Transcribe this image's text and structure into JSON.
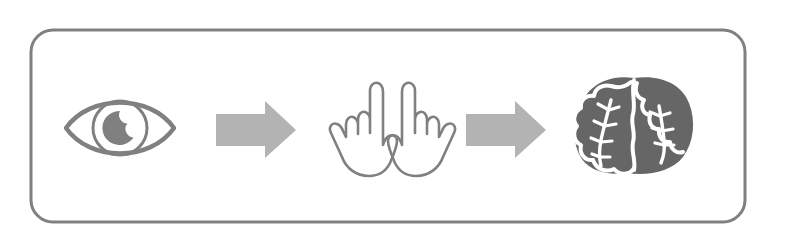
{
  "diagram": {
    "type": "process-flow",
    "title": "Look → Point → Think",
    "orientation": "horizontal",
    "background_color": "#ffffff",
    "container": {
      "shape": "rounded-rectangle",
      "stroke_color": "#808080",
      "stroke_width": 3,
      "corner_radius": 22,
      "fill": "none",
      "x": 31,
      "y": 30,
      "width": 714,
      "height": 192
    },
    "colors": {
      "outline": "#808080",
      "arrow_fill": "#b3b3b3",
      "solid_fill": "#666666",
      "vein": "#ffffff"
    },
    "steps": [
      {
        "index": 1,
        "icon": "eye-icon",
        "label": "Eye",
        "description": "Almond shaped eye with round iris and filled pupil with highlight notch",
        "style": "outline",
        "color": "#808080"
      },
      {
        "index": 2,
        "icon": "pointing-hands-icon",
        "label": "Pointing hands",
        "description": "Two mirrored hands with index fingers extended upward",
        "style": "outline",
        "color": "#808080"
      },
      {
        "index": 3,
        "icon": "brain-cabbage-icon",
        "label": "Brain",
        "description": "Solid rounded brain-like form with two lobes and white branching veins",
        "style": "filled",
        "color": "#666666"
      }
    ],
    "connectors": [
      {
        "index": 1,
        "icon": "arrow-right-icon",
        "label": "leads to",
        "direction": "right",
        "color": "#b3b3b3"
      },
      {
        "index": 2,
        "icon": "arrow-right-icon",
        "label": "leads to",
        "direction": "right",
        "color": "#b3b3b3"
      }
    ]
  }
}
